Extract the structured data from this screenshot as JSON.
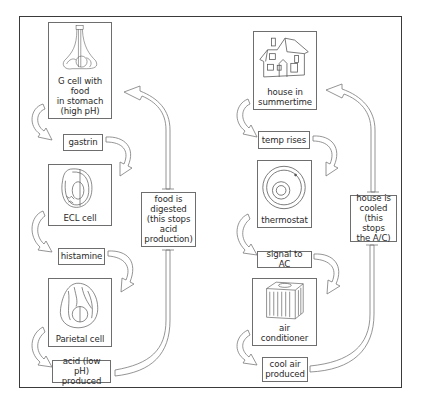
{
  "diagram": {
    "type": "negative-feedback-comparison",
    "left_loop": {
      "title_implied": "stomach acid regulation",
      "steps": [
        {
          "id": "g-cell",
          "text": "G cell with food\nin stomach\n(high pH)",
          "icon": "g-cell-icon"
        },
        {
          "id": "gastrin",
          "text": "gastrin"
        },
        {
          "id": "ecl-cell",
          "text": "ECL cell",
          "icon": "ecl-cell-icon"
        },
        {
          "id": "histamine",
          "text": "histamine"
        },
        {
          "id": "parietal-cell",
          "text": "Parietal cell",
          "icon": "parietal-cell-icon"
        },
        {
          "id": "acid",
          "text": "acid (low pH)\nproduced"
        }
      ],
      "feedback": {
        "text": "food is\ndigested\n(this stops\nacid\nproduction)"
      }
    },
    "right_loop": {
      "title_implied": "home cooling regulation",
      "steps": [
        {
          "id": "house",
          "text": "house in\nsummertime",
          "icon": "house-icon"
        },
        {
          "id": "temp",
          "text": "temp rises"
        },
        {
          "id": "thermostat",
          "text": "thermostat",
          "icon": "thermostat-icon"
        },
        {
          "id": "signal",
          "text": "signal to AC"
        },
        {
          "id": "ac",
          "text": "air conditioner",
          "icon": "air-conditioner-icon"
        },
        {
          "id": "cool-air",
          "text": "cool air\nproduced"
        }
      ],
      "feedback": {
        "text": "house is\ncooled\n(this stops\nthe A/C)"
      }
    }
  },
  "colors": {
    "line": "#6e6e6e",
    "frame": "#3a3a3a",
    "text": "#2a2a2a",
    "background": "#ffffff"
  }
}
